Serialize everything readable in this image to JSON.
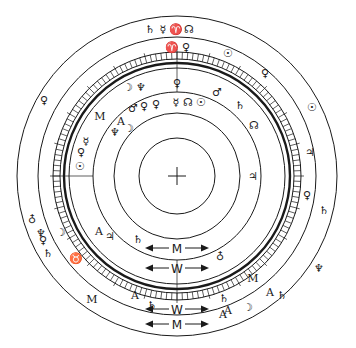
{
  "diagram": {
    "title": "",
    "center": {
      "x": 177,
      "y": 176
    },
    "center_mark": "+",
    "rings": [
      {
        "r": 160,
        "w": 1.0
      },
      {
        "r": 139,
        "w": 1.0
      },
      {
        "r": 124,
        "w": 1.0
      },
      {
        "r": 117,
        "w": 1.0
      },
      {
        "r": 113,
        "w": 2.4
      },
      {
        "r": 108,
        "w": 1.0
      },
      {
        "r": 84,
        "w": 1.0
      },
      {
        "r": 63,
        "w": 1.0
      },
      {
        "r": 38,
        "w": 1.0
      }
    ],
    "tick_band": {
      "r_outer": 124,
      "r_inner": 117,
      "count": 144
    },
    "glyphs": [
      {
        "t": "♄",
        "x": 150,
        "y": 33
      },
      {
        "t": "☿",
        "x": 163,
        "y": 33
      },
      {
        "t": "♈",
        "x": 176,
        "y": 33
      },
      {
        "t": "☊",
        "x": 189,
        "y": 33
      },
      {
        "t": "♈",
        "x": 172,
        "y": 51
      },
      {
        "t": "♀",
        "x": 186,
        "y": 51
      },
      {
        "t": "☉",
        "x": 228,
        "y": 57
      },
      {
        "t": "♀",
        "x": 265,
        "y": 77
      },
      {
        "t": "☉",
        "x": 312,
        "y": 111
      },
      {
        "t": "♀",
        "x": 44,
        "y": 104
      },
      {
        "t": "☽",
        "x": 128,
        "y": 91
      },
      {
        "t": "♆",
        "x": 141,
        "y": 91
      },
      {
        "t": "♂",
        "x": 133,
        "y": 112
      },
      {
        "t": "♀",
        "x": 144,
        "y": 110
      },
      {
        "t": "♀",
        "x": 156,
        "y": 108
      },
      {
        "t": "♀",
        "x": 177,
        "y": 87
      },
      {
        "t": "☿",
        "x": 176,
        "y": 106
      },
      {
        "t": "☊",
        "x": 188,
        "y": 106
      },
      {
        "t": "☉",
        "x": 201,
        "y": 106
      },
      {
        "t": "♂",
        "x": 217,
        "y": 96
      },
      {
        "t": "♄",
        "x": 240,
        "y": 109
      },
      {
        "t": "☊",
        "x": 254,
        "y": 129
      },
      {
        "t": "M",
        "x": 100,
        "y": 120
      },
      {
        "t": "A",
        "x": 121,
        "y": 125
      },
      {
        "t": "♆",
        "x": 115,
        "y": 136
      },
      {
        "t": "☽",
        "x": 129,
        "y": 132
      },
      {
        "t": "☿",
        "x": 86,
        "y": 145
      },
      {
        "t": "♀",
        "x": 81,
        "y": 156
      },
      {
        "t": "☉",
        "x": 80,
        "y": 170
      },
      {
        "t": "♆",
        "x": 41,
        "y": 237
      },
      {
        "t": "♄",
        "x": 48,
        "y": 257
      },
      {
        "t": "♁",
        "x": 32,
        "y": 222
      },
      {
        "t": "♀",
        "x": 43,
        "y": 244
      },
      {
        "t": "☽",
        "x": 61,
        "y": 236
      },
      {
        "t": "♉",
        "x": 76,
        "y": 262
      },
      {
        "t": "A",
        "x": 99,
        "y": 235
      },
      {
        "t": "♃",
        "x": 110,
        "y": 240
      },
      {
        "t": "♄",
        "x": 138,
        "y": 243
      },
      {
        "t": "♁",
        "x": 220,
        "y": 259
      },
      {
        "t": "♃",
        "x": 253,
        "y": 180
      },
      {
        "t": "♃",
        "x": 310,
        "y": 156
      },
      {
        "t": "♀",
        "x": 307,
        "y": 199
      },
      {
        "t": "♄",
        "x": 324,
        "y": 214
      },
      {
        "t": "♄",
        "x": 224,
        "y": 302
      },
      {
        "t": "♄",
        "x": 282,
        "y": 299
      },
      {
        "t": "M",
        "x": 253,
        "y": 282
      },
      {
        "t": "A",
        "x": 270,
        "y": 296
      },
      {
        "t": "☽",
        "x": 248,
        "y": 311
      },
      {
        "t": "A",
        "x": 228,
        "y": 314
      },
      {
        "t": "M",
        "x": 92,
        "y": 303
      },
      {
        "t": "A",
        "x": 135,
        "y": 299
      },
      {
        "t": "A",
        "x": 223,
        "y": 318
      },
      {
        "t": "♆",
        "x": 319,
        "y": 272
      },
      {
        "t": "♄",
        "x": 152,
        "y": 309
      }
    ],
    "arrows": [
      {
        "label": "M",
        "y": 248
      },
      {
        "label": "W",
        "y": 268
      },
      {
        "label": "W",
        "y": 309
      },
      {
        "label": "M",
        "y": 324
      }
    ]
  }
}
